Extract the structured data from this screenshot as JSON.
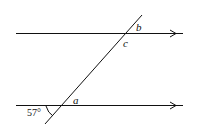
{
  "diagram": {
    "type": "parallel-lines-transversal",
    "labels": {
      "b": "b",
      "c": "c",
      "a": "a",
      "given_angle": "57°"
    },
    "colors": {
      "line": "#111111",
      "background": "#ffffff"
    }
  }
}
